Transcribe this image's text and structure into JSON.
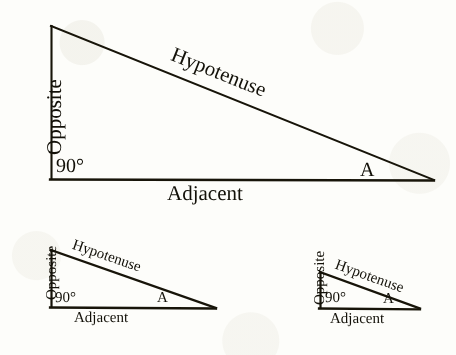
{
  "figure": {
    "type": "geometry-diagram",
    "background_color": "#fdfdfa",
    "ink_color": "#131109",
    "triangles": [
      {
        "id": "large",
        "name": "large-right-triangle",
        "vertices": {
          "apex": [
            51,
            26
          ],
          "right_angle": [
            51,
            179
          ],
          "angle_a": [
            434,
            180
          ]
        },
        "labels": {
          "opposite": "Opposite",
          "adjacent": "Adjacent",
          "hypotenuse": "Hypotenuse",
          "right_angle": "90°",
          "angle_a": "A"
        },
        "hypotenuse_rotation_deg": -21.8
      },
      {
        "id": "medium",
        "name": "medium-right-triangle",
        "vertices": {
          "apex": [
            51,
            250
          ],
          "right_angle": [
            51,
            307
          ],
          "angle_a": [
            216,
            308
          ]
        },
        "labels": {
          "opposite": "Opposite",
          "adjacent": "Adjacent",
          "hypotenuse": "Hypotenuse",
          "right_angle": "90°",
          "angle_a": "A"
        },
        "hypotenuse_rotation_deg": -19.0
      },
      {
        "id": "small",
        "name": "small-right-triangle",
        "vertices": {
          "apex": [
            320,
            272
          ],
          "right_angle": [
            320,
            308
          ],
          "angle_a": [
            420,
            308
          ]
        },
        "labels": {
          "opposite": "Opposite",
          "adjacent": "Adjacent",
          "hypotenuse": "Hypotenuse",
          "right_angle": "90°",
          "angle_a": "A"
        },
        "hypotenuse_rotation_deg": -19.8
      }
    ]
  }
}
